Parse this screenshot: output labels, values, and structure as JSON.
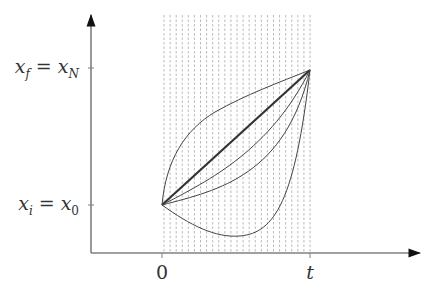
{
  "diagram": {
    "colors": {
      "axis": "#808080",
      "grid": "#a8a8a8",
      "path": "#444444",
      "straight_path": "#333333",
      "text": "#333333"
    },
    "axes": {
      "origin": [
        91,
        253
      ],
      "y_top": 15,
      "x_right": 420
    },
    "x_ticks": [
      {
        "label": "0",
        "x": 162
      },
      {
        "label": "t",
        "x": 310
      }
    ],
    "y_ticks": [
      {
        "label_lhs": "x",
        "lhs_sub": "f",
        "eq": "=",
        "label_rhs": "x",
        "rhs_sub": "N",
        "y": 68
      },
      {
        "label_lhs": "x",
        "lhs_sub": "i",
        "eq": "=",
        "label_rhs": "x",
        "rhs_sub": "0",
        "y": 205
      }
    ],
    "time_slices": {
      "x_start": 164,
      "x_end": 310,
      "count": 25,
      "y_top": 15,
      "y_bottom": 253
    },
    "start_point": [
      162,
      205
    ],
    "end_point": [
      310,
      70
    ],
    "paths": [
      {
        "name": "upper-bulge-path",
        "d": "M162,205 C166,160 185,130 215,112 C245,95 280,82 310,70"
      },
      {
        "name": "classical-straight-path",
        "d": "M162,205 L310,70",
        "thick": true
      },
      {
        "name": "middle-path-1",
        "d": "M162,205 C210,180 270,150 310,70"
      },
      {
        "name": "middle-path-2",
        "d": "M162,205 C220,190 285,175 310,70"
      },
      {
        "name": "lower-dip-path",
        "d": "M162,205 C190,225 215,238 240,236 C275,233 295,200 310,70"
      }
    ]
  }
}
